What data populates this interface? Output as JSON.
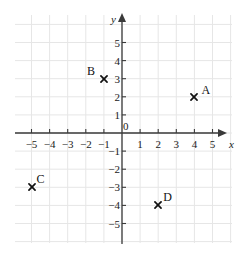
{
  "figure": {
    "axis_x_name": "x",
    "axis_y_name": "y",
    "origin_label": "0",
    "grid": "on",
    "grid_color": "#e6e6e6",
    "axis_color": "#3a3a3a",
    "point_color": "#111111"
  },
  "chart_data": {
    "type": "scatter",
    "title": "",
    "xlabel": "x",
    "ylabel": "y",
    "xlim": [
      -6,
      6
    ],
    "ylim": [
      -6,
      6
    ],
    "xticks": [
      -5,
      -4,
      -3,
      -2,
      -1,
      0,
      1,
      2,
      3,
      4,
      5
    ],
    "yticks": [
      -5,
      -4,
      -3,
      -2,
      -1,
      1,
      2,
      3,
      4,
      5
    ],
    "xtick_labels": [
      "−5",
      "−4",
      "−3",
      "−2",
      "−1",
      "0",
      "1",
      "2",
      "3",
      "4",
      "5"
    ],
    "ytick_labels": [
      "−5",
      "−4",
      "−3",
      "−2",
      "−1",
      "1",
      "2",
      "3",
      "4",
      "5"
    ],
    "grid": true,
    "legend": "none",
    "marker": "x",
    "points": [
      {
        "label": "A",
        "x": 4,
        "y": 2,
        "label_dx": 7,
        "label_dy": -13
      },
      {
        "label": "B",
        "x": -1,
        "y": 3,
        "label_dx": -17,
        "label_dy": -14
      },
      {
        "label": "C",
        "x": -5,
        "y": -3,
        "label_dx": 5,
        "label_dy": -14
      },
      {
        "label": "D",
        "x": 2,
        "y": -4,
        "label_dx": 5,
        "label_dy": -14
      }
    ]
  }
}
